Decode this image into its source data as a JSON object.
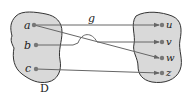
{
  "diagram": {
    "function_label": "g",
    "domain_label": "D",
    "domain_elements": [
      "a",
      "b",
      "c"
    ],
    "codomain_elements": [
      "u",
      "v",
      "w",
      "z"
    ],
    "mappings": [
      {
        "from": "a",
        "to": "u"
      },
      {
        "from": "a",
        "to": "w"
      },
      {
        "from": "b",
        "to": "v"
      },
      {
        "from": "c",
        "to": "z"
      }
    ],
    "colors": {
      "blob_fill": "#d9d9d9",
      "blob_stroke": "#333333",
      "arrow": "#666666",
      "dot": "#777777"
    }
  }
}
